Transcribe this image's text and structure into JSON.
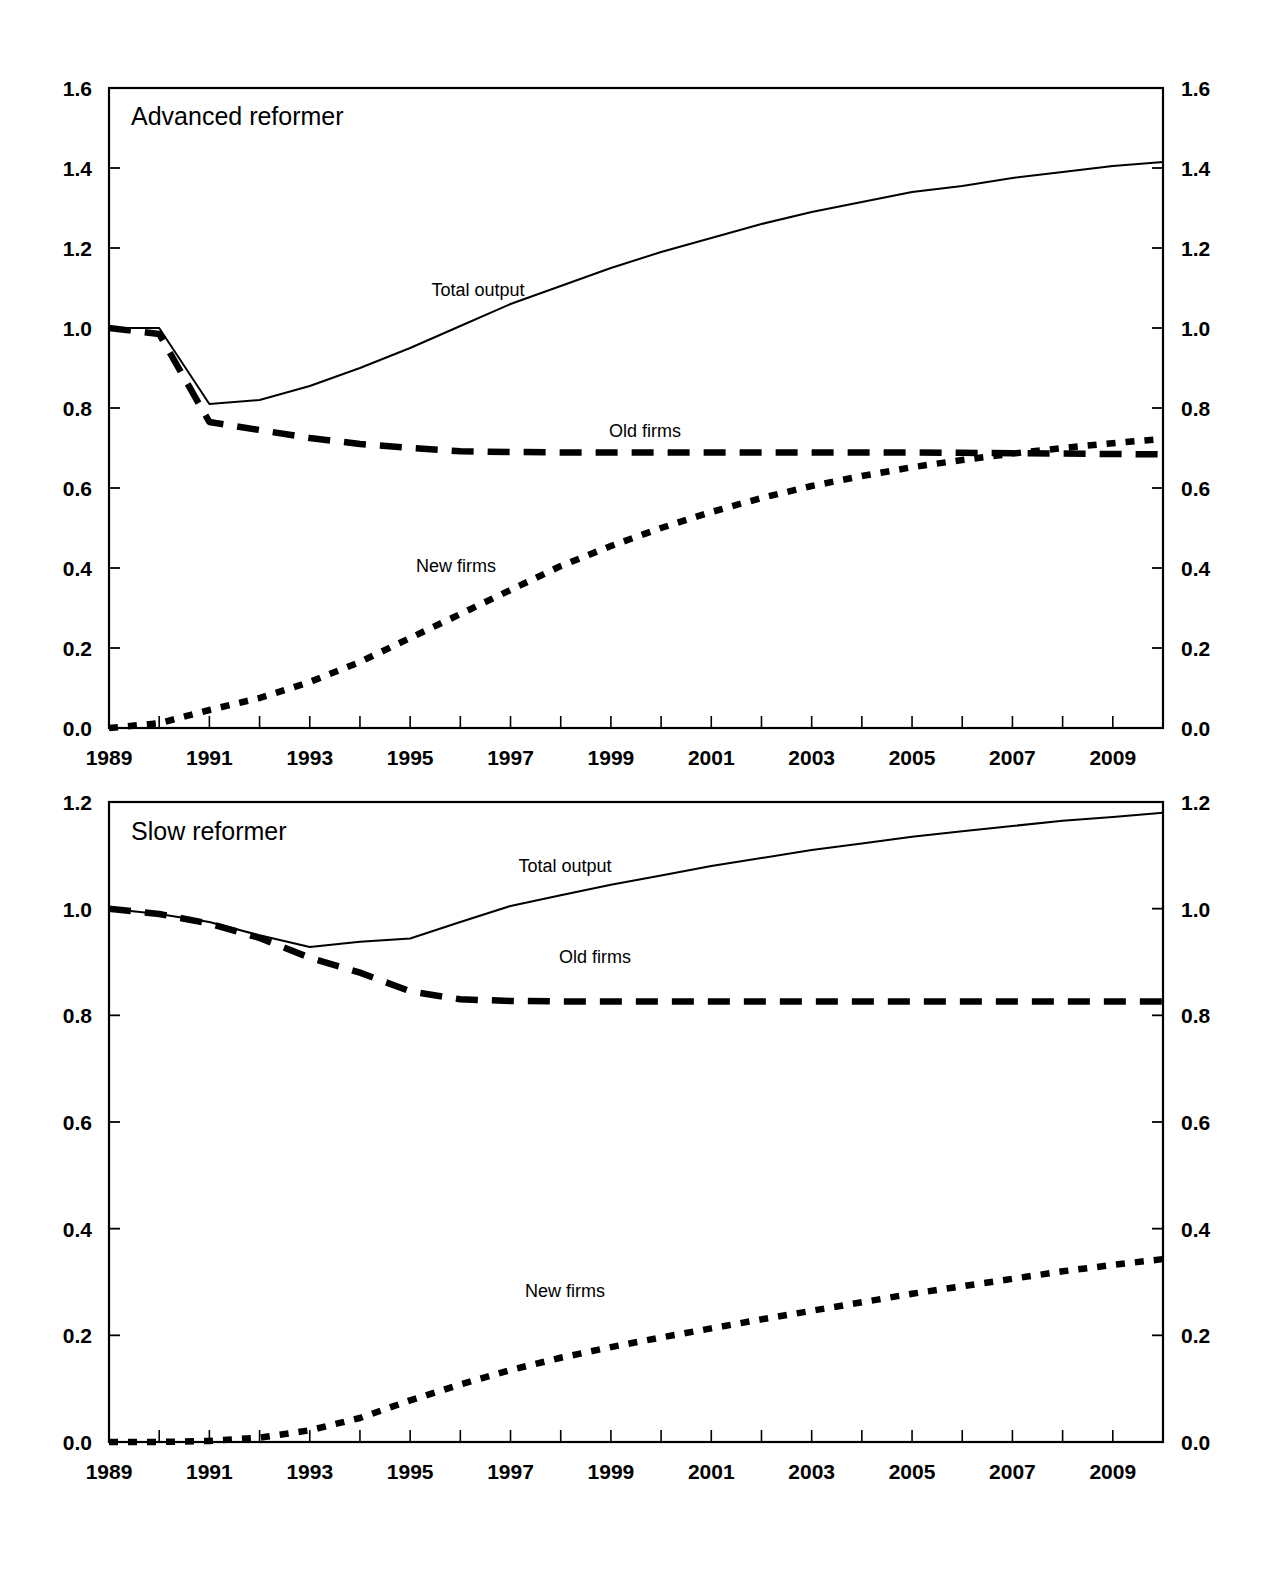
{
  "chart_data": [
    {
      "type": "line",
      "title": "Advanced reformer",
      "xlabel": "",
      "ylabel": "",
      "xlim": [
        1989,
        2010
      ],
      "ylim": [
        0.0,
        1.6
      ],
      "grid": false,
      "legend_position": "inline-annotations",
      "y_ticks": [
        "1.6",
        "1.4",
        "1.2",
        "1.0",
        "0.8",
        "0.6",
        "0.4",
        "0.2",
        "0.0"
      ],
      "y_tick_values": [
        1.6,
        1.4,
        1.2,
        1.0,
        0.8,
        0.6,
        0.4,
        0.2,
        0.0
      ],
      "y_axis_right_ticks": [
        "1.6",
        "1.4",
        "1.2",
        "1.0",
        "0.8",
        "0.6",
        "0.4",
        "0.2",
        "0.0"
      ],
      "x_ticks": [
        "1989",
        "1991",
        "1993",
        "1995",
        "1997",
        "1999",
        "2001",
        "2003",
        "2005",
        "2007",
        "2009"
      ],
      "x_tick_values": [
        1989,
        1991,
        1993,
        1995,
        1997,
        1999,
        2001,
        2003,
        2005,
        2007,
        2009
      ],
      "x": [
        1989,
        1990,
        1991,
        1992,
        1993,
        1994,
        1995,
        1996,
        1997,
        1998,
        1999,
        2000,
        2001,
        2002,
        2003,
        2004,
        2005,
        2006,
        2007,
        2008,
        2009,
        2010
      ],
      "series": [
        {
          "name": "Total output",
          "style": "solid",
          "values": [
            1.0,
            1.0,
            0.81,
            0.82,
            0.855,
            0.9,
            0.95,
            1.005,
            1.06,
            1.105,
            1.15,
            1.19,
            1.225,
            1.26,
            1.29,
            1.315,
            1.34,
            1.355,
            1.375,
            1.39,
            1.405,
            1.415
          ]
        },
        {
          "name": "Old firms",
          "style": "dashed",
          "values": [
            1.0,
            0.985,
            0.765,
            0.745,
            0.725,
            0.71,
            0.7,
            0.692,
            0.69,
            0.689,
            0.689,
            0.689,
            0.689,
            0.689,
            0.689,
            0.689,
            0.689,
            0.688,
            0.687,
            0.686,
            0.685,
            0.684
          ]
        },
        {
          "name": "New firms",
          "style": "dotted",
          "values": [
            0.0,
            0.012,
            0.045,
            0.075,
            0.115,
            0.165,
            0.225,
            0.285,
            0.345,
            0.405,
            0.455,
            0.5,
            0.54,
            0.575,
            0.605,
            0.63,
            0.652,
            0.67,
            0.686,
            0.7,
            0.712,
            0.723
          ]
        }
      ]
    },
    {
      "type": "line",
      "title": "Slow reformer",
      "xlabel": "",
      "ylabel": "",
      "xlim": [
        1989,
        2010
      ],
      "ylim": [
        0.0,
        1.2
      ],
      "grid": false,
      "legend_position": "inline-annotations",
      "y_ticks": [
        "1.2",
        "1.0",
        "0.8",
        "0.6",
        "0.4",
        "0.2",
        "0.0"
      ],
      "y_tick_values": [
        1.2,
        1.0,
        0.8,
        0.6,
        0.4,
        0.2,
        0.0
      ],
      "y_axis_right_ticks": [
        "1.2",
        "1.0",
        "0.8",
        "0.6",
        "0.4",
        "0.2",
        "0.0"
      ],
      "x_ticks": [
        "1989",
        "1991",
        "1993",
        "1995",
        "1997",
        "1999",
        "2001",
        "2003",
        "2005",
        "2007",
        "2009"
      ],
      "x_tick_values": [
        1989,
        1991,
        1993,
        1995,
        1997,
        1999,
        2001,
        2003,
        2005,
        2007,
        2009
      ],
      "x": [
        1989,
        1990,
        1991,
        1992,
        1993,
        1994,
        1995,
        1996,
        1997,
        1998,
        1999,
        2000,
        2001,
        2002,
        2003,
        2004,
        2005,
        2006,
        2007,
        2008,
        2009,
        2010
      ],
      "series": [
        {
          "name": "Total output",
          "style": "solid",
          "values": [
            1.0,
            0.99,
            0.975,
            0.95,
            0.928,
            0.938,
            0.944,
            0.975,
            1.005,
            1.025,
            1.045,
            1.062,
            1.08,
            1.095,
            1.11,
            1.122,
            1.135,
            1.145,
            1.155,
            1.165,
            1.172,
            1.18
          ]
        },
        {
          "name": "Old firms",
          "style": "dashed",
          "values": [
            1.0,
            0.99,
            0.972,
            0.945,
            0.908,
            0.88,
            0.845,
            0.83,
            0.827,
            0.826,
            0.826,
            0.826,
            0.826,
            0.826,
            0.826,
            0.826,
            0.826,
            0.826,
            0.826,
            0.826,
            0.826,
            0.826
          ]
        },
        {
          "name": "New firms",
          "style": "dotted",
          "values": [
            0.0,
            0.0,
            0.002,
            0.008,
            0.022,
            0.045,
            0.078,
            0.108,
            0.135,
            0.158,
            0.178,
            0.196,
            0.213,
            0.23,
            0.246,
            0.262,
            0.278,
            0.292,
            0.306,
            0.32,
            0.332,
            0.343
          ]
        }
      ]
    }
  ],
  "panels": [
    {
      "id": "advanced-reformer",
      "title": "Advanced reformer",
      "annotations": [
        {
          "label": "Total output",
          "x": 478,
          "y": 296
        },
        {
          "label": "Old firms",
          "x": 645,
          "y": 437
        },
        {
          "label": "New firms",
          "x": 456,
          "y": 572
        }
      ]
    },
    {
      "id": "slow-reformer",
      "title": "Slow reformer",
      "annotations": [
        {
          "label": "Total output",
          "x": 565,
          "y": 872
        },
        {
          "label": "Old firms",
          "x": 595,
          "y": 963
        },
        {
          "label": "New firms",
          "x": 565,
          "y": 1297
        }
      ]
    }
  ],
  "colors": {
    "axis": "#000000",
    "series": "#000000",
    "background": "#ffffff"
  }
}
